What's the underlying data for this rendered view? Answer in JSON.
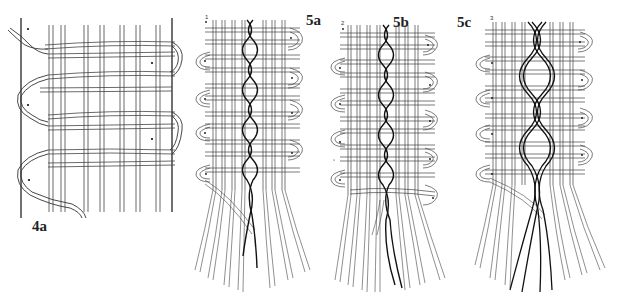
{
  "figure": {
    "background": "#ffffff",
    "line_color": "#333333",
    "braid_color": "#1a1a1a",
    "panels": [
      {
        "id": "4a",
        "label": "4a",
        "sublabel": "",
        "description": "Plain weave with pairs of wefts twisted around outer warp at both selvedges"
      },
      {
        "id": "5a",
        "label": "5a",
        "sublabel": "1",
        "description": "Woven band with single dark twisted pair running down center, strands splaying at bottom"
      },
      {
        "id": "5b",
        "label": "5b",
        "sublabel": "2",
        "description": "Woven band with dark twisted pair crossing center, strands extended at bottom"
      },
      {
        "id": "5c",
        "label": "5c",
        "sublabel": "3",
        "description": "Woven band with multiple dark strands braided down center, strands extended at bottom"
      }
    ]
  }
}
